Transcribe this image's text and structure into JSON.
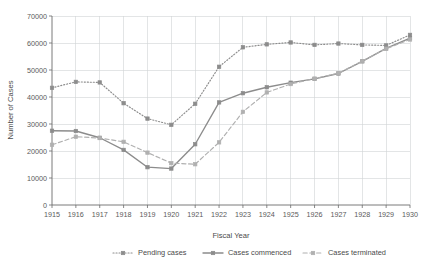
{
  "chart_data": {
    "type": "line",
    "title": "",
    "xlabel": "Fiscal Year",
    "ylabel": "Number of Cases",
    "categories": [
      1915,
      1916,
      1917,
      1918,
      1919,
      1920,
      1921,
      1922,
      1923,
      1924,
      1925,
      1926,
      1927,
      1928,
      1929,
      1930
    ],
    "xtick_labels": [
      "1915",
      "1916",
      "1917",
      "1918",
      "1919",
      "1920",
      "1921",
      "1922",
      "1923",
      "1924",
      "1925",
      "1926",
      "1927",
      "1928",
      "1929",
      "1930"
    ],
    "ytick_labels": [
      "0",
      "10000",
      "20000",
      "30000",
      "40000",
      "50000",
      "60000",
      "70000"
    ],
    "ytick_values": [
      0,
      10000,
      20000,
      30000,
      40000,
      50000,
      60000,
      70000
    ],
    "ylim": [
      0,
      70000
    ],
    "xlim": [
      1915,
      1930
    ],
    "grid": true,
    "legend_position": "bottom",
    "series": [
      {
        "name": "Pending cases",
        "style": "dotted",
        "color": "#8c8c8c",
        "marker": "square",
        "values": [
          43400,
          45600,
          45400,
          37700,
          32000,
          29700,
          37500,
          51200,
          58400,
          59500,
          60200,
          59300,
          59800,
          59300,
          59100,
          63000
        ]
      },
      {
        "name": "Cases commenced",
        "style": "solid",
        "color": "#8c8c8c",
        "marker": "square",
        "values": [
          27500,
          27400,
          24900,
          20400,
          14000,
          13500,
          22500,
          38000,
          41400,
          43600,
          45300,
          46700,
          48700,
          53200,
          58000,
          61800
        ]
      },
      {
        "name": "Cases terminated",
        "style": "dashed",
        "color": "#b0b0b0",
        "marker": "square",
        "values": [
          22300,
          25300,
          24800,
          23400,
          19400,
          15500,
          15100,
          23200,
          34500,
          41700,
          44800,
          46800,
          48800,
          53300,
          57900,
          61300
        ]
      }
    ]
  },
  "legend": {
    "items": [
      {
        "label": "Pending cases"
      },
      {
        "label": "Cases commenced"
      },
      {
        "label": "Cases terminated"
      }
    ]
  }
}
